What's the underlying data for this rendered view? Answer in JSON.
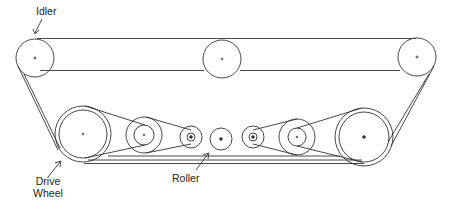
{
  "diagram": {
    "type": "belt-drive track mechanism",
    "labels": {
      "idler": "Idler",
      "drive_wheel_line1": "Drive",
      "drive_wheel_line2": "Wheel",
      "roller": "Roller"
    },
    "colors": {
      "line": "#333333",
      "background": "#ffffff"
    },
    "components": [
      {
        "name": "Idler (left)",
        "cx": 35,
        "cy": 58,
        "r": 19
      },
      {
        "name": "Idler (middle)",
        "cx": 222,
        "cy": 59,
        "r": 19
      },
      {
        "name": "Idler (right)",
        "cx": 417,
        "cy": 57,
        "r": 19
      },
      {
        "name": "Drive Wheel",
        "cx": 83,
        "cy": 134,
        "r_outer": 28,
        "r_inner": 24
      },
      {
        "name": "Pulley (left middle)",
        "cx": 144,
        "cy": 135,
        "r_outer": 18,
        "r_inner": 10
      },
      {
        "name": "Pulley (left small)",
        "cx": 191,
        "cy": 137,
        "r_outer": 11,
        "r_inner": 4
      },
      {
        "name": "Roller",
        "cx": 221,
        "cy": 139,
        "r": 11
      },
      {
        "name": "Pulley (right small)",
        "cx": 253,
        "cy": 137,
        "r_outer": 11,
        "r_inner": 4
      },
      {
        "name": "Pulley (right middle)",
        "cx": 297,
        "cy": 137,
        "r_outer": 18,
        "r_inner": 9
      },
      {
        "name": "Wheel (right large)",
        "cx": 364,
        "cy": 137,
        "r_outer": 29,
        "r_inner": 25
      }
    ]
  }
}
